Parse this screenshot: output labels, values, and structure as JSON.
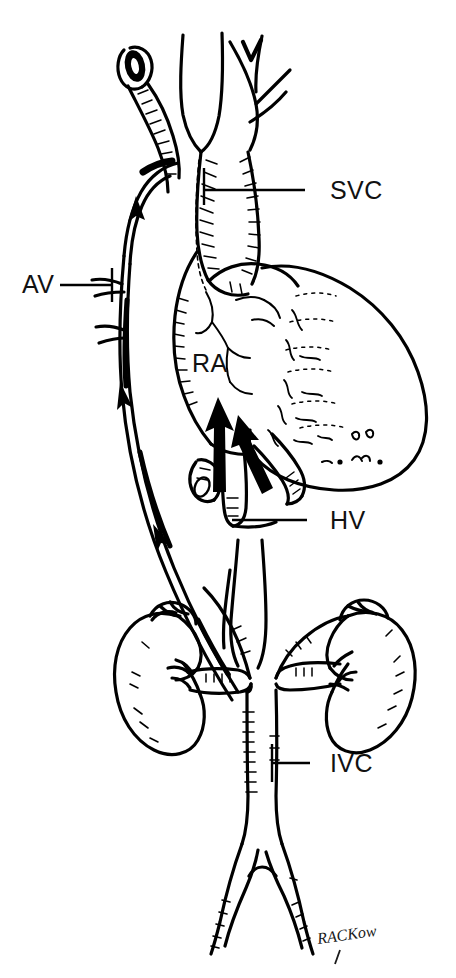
{
  "figure": {
    "background_color": "#ffffff",
    "ink_color": "#000000",
    "width": 456,
    "height": 978
  },
  "labels": [
    {
      "id": "svc",
      "text": "SVC",
      "meaning": "superior-vena-cava",
      "x": 330,
      "y": 199,
      "leader": {
        "x1": 203,
        "y1": 190,
        "x2": 305,
        "y2": 190
      }
    },
    {
      "id": "av",
      "text": "AV",
      "meaning": "azygos-vein",
      "x": 22,
      "y": 293,
      "leader": {
        "x1": 60,
        "y1": 285,
        "x2": 112,
        "y2": 285
      }
    },
    {
      "id": "ra",
      "text": "RA",
      "meaning": "right-atrium",
      "x": 192,
      "y": 372,
      "leader": null
    },
    {
      "id": "hv",
      "text": "HV",
      "meaning": "hepatic-veins",
      "x": 330,
      "y": 529,
      "leader": {
        "x1": 232,
        "y1": 520,
        "x2": 307,
        "y2": 520
      }
    },
    {
      "id": "ivc",
      "text": "IVC",
      "meaning": "inferior-vena-cava",
      "x": 330,
      "y": 772,
      "leader": {
        "x1": 272,
        "y1": 763,
        "x2": 310,
        "y2": 763
      }
    }
  ],
  "signature": {
    "text": "RACKow",
    "x": 318,
    "y": 944
  },
  "structures": [
    {
      "name": "superior-vena-cava"
    },
    {
      "name": "azygos-vein-arch"
    },
    {
      "name": "brachiocephalic-veins"
    },
    {
      "name": "right-atrium"
    },
    {
      "name": "liver"
    },
    {
      "name": "hepatic-veins"
    },
    {
      "name": "inferior-vena-cava"
    },
    {
      "name": "left-kidney"
    },
    {
      "name": "right-kidney"
    },
    {
      "name": "renal-veins"
    },
    {
      "name": "common-iliac-veins"
    },
    {
      "name": "flow-arrows"
    }
  ]
}
